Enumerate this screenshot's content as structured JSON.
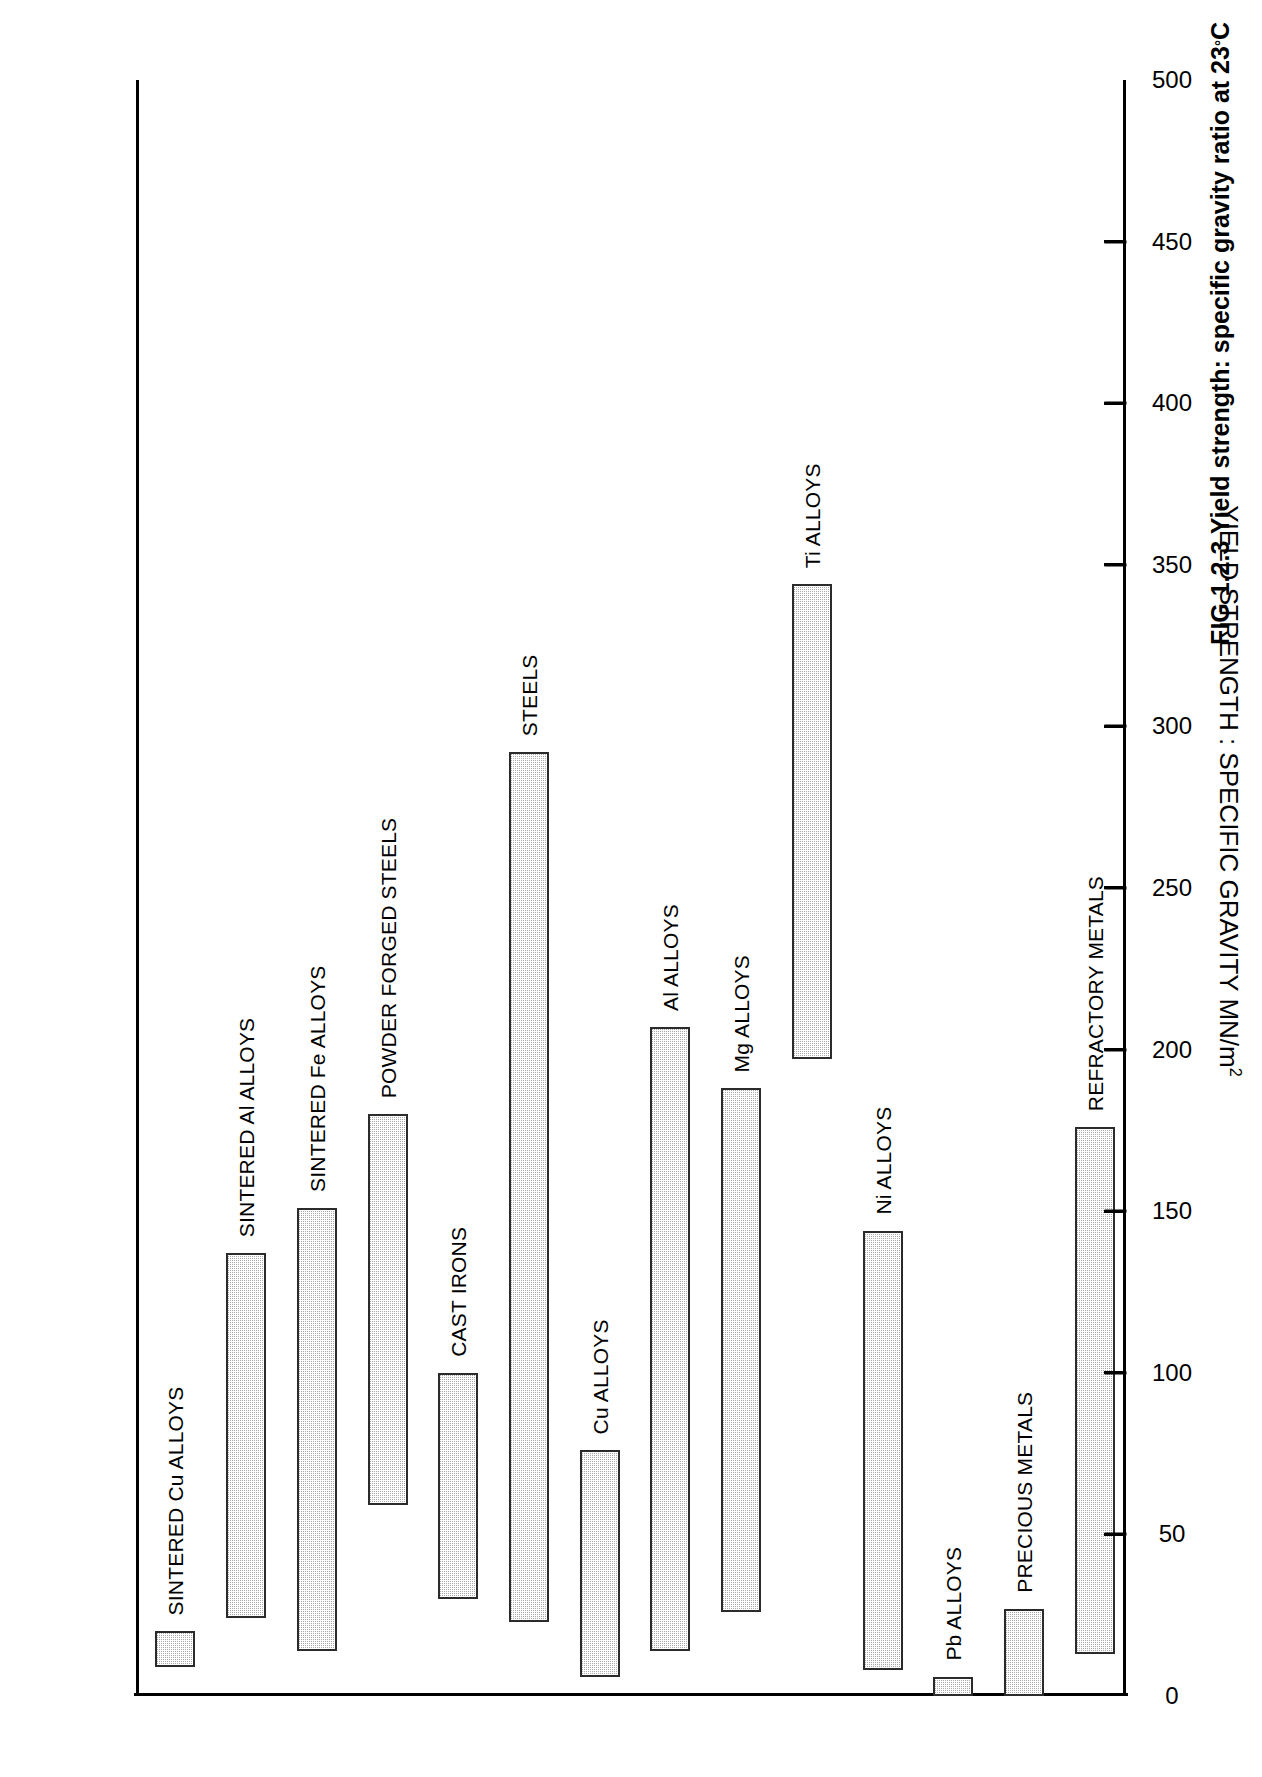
{
  "figure": {
    "caption_prefix": "FIG 1.2.3",
    "caption_text": "Yield strength: specific gravity ratio at 23",
    "caption_suffix": "C",
    "caption_degree": "°",
    "caption_full": "FIG 1.2.3 Yield strength: specific gravity ratio at 23°C"
  },
  "chart_data": {
    "type": "bar",
    "orientation": "rotated-vertical",
    "title": "",
    "xlabel": "",
    "ylabel": "YIELD STRENGTH : SPECIFIC GRAVITY MN/m",
    "ylabel_exponent": "2",
    "ylabel_full": "YIELD STRENGTH : SPECIFIC GRAVITY MN/m2",
    "ylim": [
      0,
      500
    ],
    "ytick_values": [
      0,
      50,
      100,
      150,
      200,
      250,
      300,
      350,
      400,
      450,
      500
    ],
    "ytick_labels": [
      "0",
      "50",
      "100",
      "150",
      "200",
      "250",
      "300",
      "350",
      "400",
      "450",
      "500"
    ],
    "grid": false,
    "legend": false,
    "value_type": "range",
    "categories": [
      "SINTERED Cu ALLOYS",
      "SINTERED Al ALLOYS",
      "SINTERED Fe ALLOYS",
      "POWDER FORGED STEELS",
      "CAST IRONS",
      "STEELS",
      "Cu ALLOYS",
      "Al ALLOYS",
      "Mg ALLOYS",
      "Ti ALLOYS",
      "Ni ALLOYS",
      "Pb ALLOYS",
      "PRECIOUS METALS",
      "REFRACTORY METALS"
    ],
    "bars": [
      {
        "label": "SINTERED Cu ALLOYS",
        "low": 9,
        "high": 20
      },
      {
        "label": "SINTERED Al ALLOYS",
        "low": 24,
        "high": 137
      },
      {
        "label": "SINTERED Fe ALLOYS",
        "low": 14,
        "high": 151
      },
      {
        "label": "POWDER FORGED STEELS",
        "low": 59,
        "high": 180
      },
      {
        "label": "CAST IRONS",
        "low": 30,
        "high": 100
      },
      {
        "label": "STEELS",
        "low": 23,
        "high": 292
      },
      {
        "label": "Cu ALLOYS",
        "low": 6,
        "high": 76
      },
      {
        "label": "Al ALLOYS",
        "low": 14,
        "high": 207
      },
      {
        "label": "Mg ALLOYS",
        "low": 26,
        "high": 188
      },
      {
        "label": "Ti ALLOYS",
        "low": 197,
        "high": 344
      },
      {
        "label": "Ni ALLOYS",
        "low": 8,
        "high": 144
      },
      {
        "label": "Pb ALLOYS",
        "low": 0,
        "high": 6
      },
      {
        "label": "PRECIOUS METALS",
        "low": 0,
        "high": 27
      },
      {
        "label": "REFRACTORY METALS",
        "low": 13,
        "high": 176
      }
    ]
  }
}
